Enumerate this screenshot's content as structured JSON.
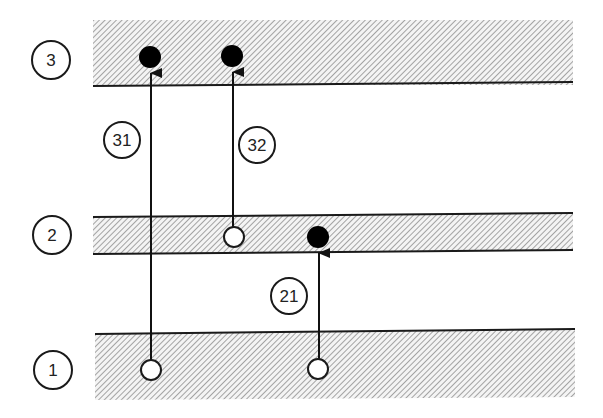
{
  "diagram": {
    "type": "energy-level-transition-diagram",
    "colors": {
      "line": "#1a1a1a",
      "hatch": "#9a9a9a",
      "band_bg": "#f2f2f2",
      "filled_dot": "#000000",
      "open_dot": "#ffffff"
    },
    "levels": [
      {
        "id": "level-3",
        "label": "3",
        "y_top": 20,
        "y_bottom": 85,
        "has_top_border": false,
        "has_bottom_border": true
      },
      {
        "id": "level-2",
        "label": "2",
        "y_top": 216,
        "y_bottom": 252,
        "has_top_border": true,
        "has_bottom_border": true
      },
      {
        "id": "level-1",
        "label": "1",
        "y_top": 332,
        "y_bottom": 399,
        "has_top_border": true,
        "has_bottom_border": false
      }
    ],
    "transitions": [
      {
        "id": "transition-31",
        "label": "31",
        "from_level": "1",
        "to_level": "3"
      },
      {
        "id": "transition-32",
        "label": "32",
        "from_level": "2",
        "to_level": "3"
      },
      {
        "id": "transition-21",
        "label": "21",
        "from_level": "1",
        "to_level": "2"
      }
    ],
    "states": [
      {
        "level": "3",
        "kind": "filled",
        "x": 150,
        "y": 57
      },
      {
        "level": "3",
        "kind": "filled",
        "x": 232,
        "y": 56
      },
      {
        "level": "2",
        "kind": "open",
        "x": 234,
        "y": 237
      },
      {
        "level": "2",
        "kind": "filled",
        "x": 318,
        "y": 237
      },
      {
        "level": "1",
        "kind": "open",
        "x": 151,
        "y": 370
      },
      {
        "level": "1",
        "kind": "open",
        "x": 318,
        "y": 369
      }
    ]
  }
}
